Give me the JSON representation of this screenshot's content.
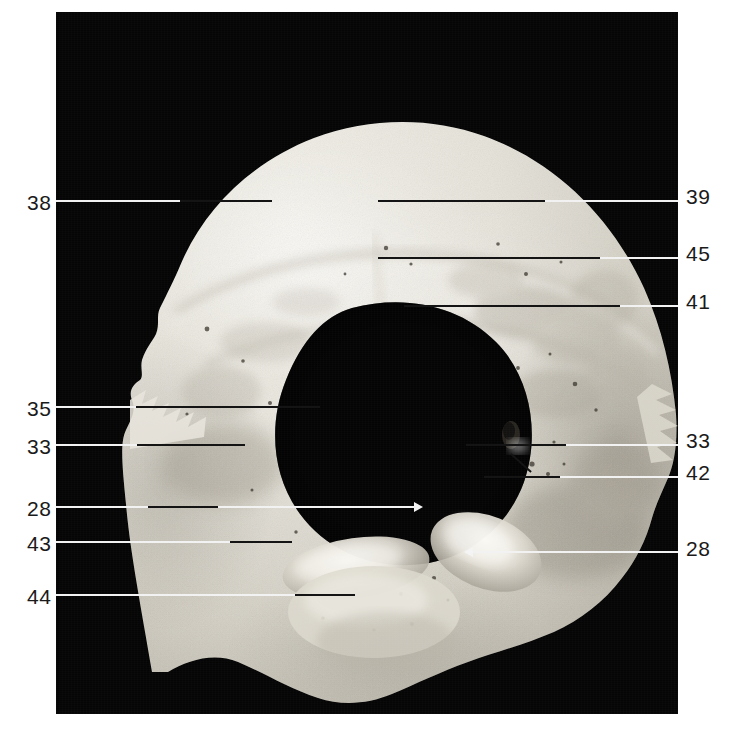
{
  "figure": {
    "kind": "anatomical-photograph",
    "plate_background_color": "#050505",
    "bone_color": "#e3e0d8",
    "label_color": "#1a1a1a",
    "leader_over_black_color": "#f2f2f2",
    "leader_over_bone_color": "#141414",
    "arrow_color": "#f4f4f4"
  },
  "labels": {
    "left": [
      {
        "id": "label-38",
        "text": "38",
        "x": 27,
        "y": 192,
        "leader_y": 201,
        "leader_from": 56,
        "leader_to": 272,
        "black_to": 180
      },
      {
        "id": "label-35",
        "text": "35",
        "x": 27,
        "y": 398,
        "leader_y": 407,
        "leader_from": 56,
        "leader_to": 320,
        "black_to": 136
      },
      {
        "id": "label-33",
        "text": "33",
        "x": 27,
        "y": 436,
        "leader_y": 445,
        "leader_from": 56,
        "leader_to": 245,
        "black_to": 137
      },
      {
        "id": "label-28",
        "text": "28",
        "x": 27,
        "y": 498,
        "leader_y": 507,
        "leader_from": 56,
        "leader_to": 414,
        "black_to": 148
      },
      {
        "id": "label-43",
        "text": "43",
        "x": 27,
        "y": 533,
        "leader_y": 542,
        "leader_from": 56,
        "leader_to": 275,
        "black_to": 230
      },
      {
        "id": "label-44",
        "text": "44",
        "x": 27,
        "y": 586,
        "leader_y": 595,
        "leader_from": 56,
        "leader_to": 355,
        "black_to": 295
      }
    ],
    "right": [
      {
        "id": "label-39",
        "text": "39",
        "x": 686,
        "y": 186,
        "leader_y": 201,
        "leader_from": 378,
        "leader_to": 678,
        "bone_to": 545
      },
      {
        "id": "label-45",
        "text": "45",
        "x": 686,
        "y": 243,
        "leader_y": 258,
        "leader_from": 378,
        "leader_to": 678,
        "bone_to": 600
      },
      {
        "id": "label-41",
        "text": "41",
        "x": 686,
        "y": 291,
        "leader_y": 306,
        "leader_from": 404,
        "leader_to": 678,
        "bone_to": 620
      },
      {
        "id": "label-33",
        "text": "33",
        "x": 686,
        "y": 430,
        "leader_y": 445,
        "leader_from": 482,
        "leader_to": 678,
        "bone_to": 566
      },
      {
        "id": "label-42",
        "text": "42",
        "x": 686,
        "y": 462,
        "leader_y": 477,
        "leader_from": 484,
        "leader_to": 678,
        "bone_to": 560
      },
      {
        "id": "label-28",
        "text": "28",
        "x": 686,
        "y": 538,
        "leader_y": 552,
        "leader_from": 472,
        "leader_to": 678,
        "bone_to": 560
      }
    ]
  },
  "arrows": [
    {
      "id": "arrow-28-left",
      "direction": "right",
      "x": 414,
      "y": 502,
      "points_to": "occipital condyle (left side of image)"
    },
    {
      "id": "arrow-28-right",
      "direction": "left",
      "x": 464,
      "y": 546,
      "points_to": "occipital condyle (right side of image)"
    }
  ],
  "diagonal_tick": {
    "id": "tick-42",
    "x1": 513,
    "y1": 455,
    "x2": 533,
    "y2": 473,
    "color": "#141414"
  },
  "anatomy_notes": {
    "foramen_magnum": "large central oval aperture",
    "condyles": "paired oval articular surfaces flanking the foramen magnum, indicated by the two white arrows labelled 28",
    "sutural_margins": "jagged lambdoid borders along the upper-left and right edges"
  }
}
